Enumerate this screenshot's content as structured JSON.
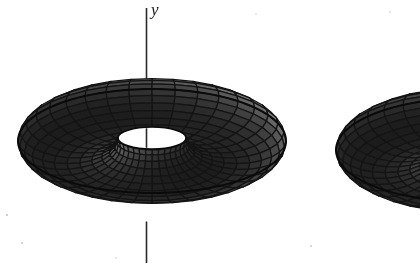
{
  "figure": {
    "kind": "surface-of-revolution-diagram",
    "caption_text": "",
    "background_color": "#ffffff",
    "width": 420,
    "height": 267
  },
  "axes": [
    {
      "name": "y-axis",
      "label": "y",
      "orientation": "vertical",
      "x": 146.5,
      "y_top": 8,
      "y_bottom": 263,
      "color": "#2a2a2a",
      "line_width": 1.6,
      "label_position": {
        "x": 151,
        "y": 1
      }
    }
  ],
  "shapes": [
    {
      "name": "torus-left",
      "label": "",
      "center": {
        "x": 152,
        "y": 141
      },
      "outer_radius_x": 134,
      "outer_radius_y": 52,
      "tube_radius": 49,
      "tilt_degrees": 0,
      "hole": {
        "cx": 152,
        "cy": 138,
        "rx": 34,
        "ry": 11,
        "fill": "#ffffff"
      },
      "mesh": {
        "meridians": 36,
        "parallels": 24
      },
      "colors": {
        "light": "#b4b4b4",
        "mid": "#8c8c8c",
        "dark": "#4a4a4a",
        "darkest": "#1c1c1c",
        "line": "#141414",
        "outline": "#0a0a0a"
      }
    },
    {
      "name": "torus-right",
      "label": "",
      "center": {
        "x": 470,
        "y": 150
      },
      "outer_radius_x": 134,
      "outer_radius_y": 52,
      "tube_radius": 49,
      "tilt_degrees": 0,
      "hole": {
        "cx": 470,
        "cy": 147,
        "rx": 34,
        "ry": 11,
        "fill": "#ffffff"
      },
      "mesh": {
        "meridians": 36,
        "parallels": 24
      },
      "clipped_at_right_edge": true,
      "colors": {
        "light": "#b4b4b4",
        "mid": "#8c8c8c",
        "dark": "#4a4a4a",
        "darkest": "#1c1c1c",
        "line": "#141414",
        "outline": "#0a0a0a"
      }
    }
  ],
  "palette": {
    "page_background": "#ffffff",
    "ink": "#141414",
    "surface_light": "#b4b4b4",
    "surface_mid": "#8c8c8c",
    "surface_dark": "#4a4a4a",
    "surface_shadow": "#1c1c1c",
    "axis": "#2a2a2a"
  },
  "speckles": [
    {
      "x": 7,
      "y": 215,
      "r": 1.1
    },
    {
      "x": 22,
      "y": 243,
      "r": 0.9
    },
    {
      "x": 390,
      "y": 12,
      "r": 0.8
    },
    {
      "x": 311,
      "y": 246,
      "r": 0.9
    },
    {
      "x": 116,
      "y": 258,
      "r": 0.7
    },
    {
      "x": 256,
      "y": 14,
      "r": 0.7
    }
  ]
}
